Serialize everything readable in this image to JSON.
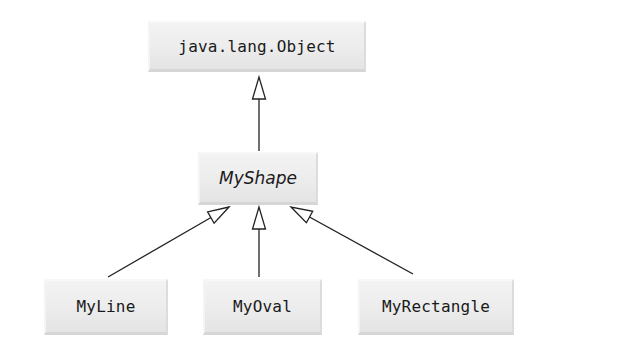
{
  "diagram": {
    "type": "uml-class-hierarchy",
    "relationship": "inheritance (generalization, hollow triangle arrowheads)",
    "classes": [
      {
        "id": "object",
        "label": "java.lang.Object",
        "abstract": false
      },
      {
        "id": "myshape",
        "label": "MyShape",
        "abstract": true
      },
      {
        "id": "myline",
        "label": "MyLine",
        "abstract": false
      },
      {
        "id": "myoval",
        "label": "MyOval",
        "abstract": false
      },
      {
        "id": "myrectangle",
        "label": "MyRectangle",
        "abstract": false
      }
    ],
    "edges": [
      {
        "from": "myshape",
        "to": "object"
      },
      {
        "from": "myline",
        "to": "myshape"
      },
      {
        "from": "myoval",
        "to": "myshape"
      },
      {
        "from": "myrectangle",
        "to": "myshape"
      }
    ],
    "colors": {
      "box_fill": "#ececec",
      "line": "#222222",
      "arrowhead_fill": "#ffffff",
      "text": "#1a1a1a"
    }
  }
}
